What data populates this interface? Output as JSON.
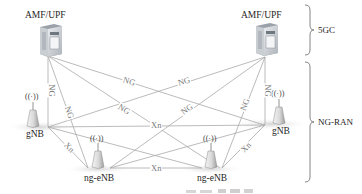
{
  "diagram": {
    "title_caption": "",
    "nodes": {
      "amf_left": {
        "label": "AMF/UPF",
        "type": "server"
      },
      "amf_right": {
        "label": "AMF/UPF",
        "type": "server"
      },
      "gnb_left": {
        "label": "gNB",
        "type": "base-station"
      },
      "gnb_right": {
        "label": "gNB",
        "type": "base-station"
      },
      "enb_left": {
        "label": "ng-eNB",
        "type": "base-station"
      },
      "enb_right": {
        "label": "ng-eNB",
        "type": "base-station"
      }
    },
    "antenna_glyph": "((·))",
    "groups": {
      "core": {
        "label": "5GC"
      },
      "ran": {
        "label": "NG-RAN"
      }
    },
    "edges": [
      {
        "from": "amf_left",
        "to": "gnb_left",
        "label": "NG"
      },
      {
        "from": "amf_left",
        "to": "enb_left",
        "label": "NG"
      },
      {
        "from": "amf_left",
        "to": "enb_right",
        "label": "NG"
      },
      {
        "from": "amf_left",
        "to": "gnb_right",
        "label": "NG"
      },
      {
        "from": "amf_right",
        "to": "gnb_left",
        "label": "NG"
      },
      {
        "from": "amf_right",
        "to": "enb_left",
        "label": "NG"
      },
      {
        "from": "amf_right",
        "to": "enb_right",
        "label": "NG"
      },
      {
        "from": "amf_right",
        "to": "gnb_right",
        "label": "NG"
      },
      {
        "from": "gnb_left",
        "to": "gnb_right",
        "label": "Xn"
      },
      {
        "from": "gnb_left",
        "to": "enb_left",
        "label": "Xn"
      },
      {
        "from": "enb_left",
        "to": "enb_right",
        "label": "Xn"
      },
      {
        "from": "enb_right",
        "to": "gnb_right",
        "label": "Xn"
      },
      {
        "from": "gnb_left",
        "to": "enb_right",
        "label": ""
      },
      {
        "from": "enb_left",
        "to": "gnb_right",
        "label": ""
      }
    ],
    "edge_labels": {
      "ng": "NG",
      "xn": "Xn"
    },
    "colors": {
      "line": "#a9a9a9",
      "edge_label": "#7a7a7a",
      "server_body": "#c8cdd2",
      "shadow": "#dcdcdc"
    }
  }
}
